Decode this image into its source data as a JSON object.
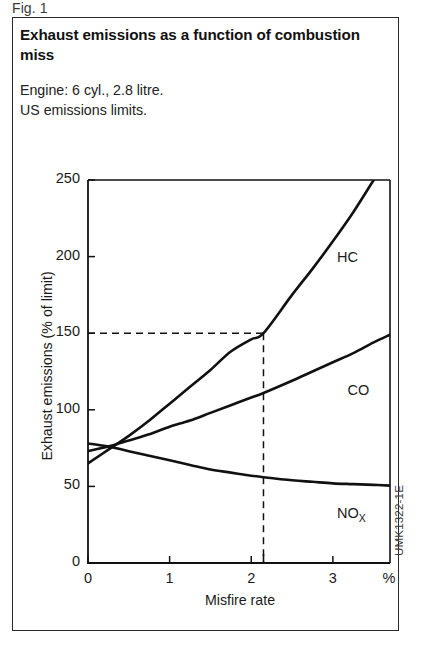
{
  "figure_number": "Fig. 1",
  "title": "Exhaust emissions as a function of combustion miss",
  "subtitle_lines": [
    "Engine: 6 cyl., 2.8 litre.",
    "US emissions limits."
  ],
  "source_code": "UMK1322-1E",
  "colors": {
    "ink": "#1a1a1a",
    "border": "#2b2b2b",
    "curve": "#111111",
    "background": "#ffffff"
  },
  "chart_data": {
    "type": "line",
    "title": "Exhaust emissions as a function of combustion miss",
    "xlabel": "Misfire rate",
    "ylabel": "Exhaust emissions (% of limit)",
    "x_unit": "%",
    "xlim": [
      0,
      3.7
    ],
    "ylim": [
      0,
      250
    ],
    "xticks": [
      0,
      1,
      2,
      3
    ],
    "xtick_labels": [
      "0",
      "1",
      "2",
      "3"
    ],
    "yticks": [
      0,
      50,
      100,
      150,
      200,
      250
    ],
    "ytick_labels": [
      "0",
      "50",
      "100",
      "150",
      "200",
      "250"
    ],
    "grid": false,
    "legend": "inline-curve-labels",
    "series": [
      {
        "name": "HC",
        "label": "HC",
        "x": [
          0,
          0.25,
          0.5,
          0.75,
          1.0,
          1.25,
          1.5,
          1.75,
          2.0,
          2.15,
          2.5,
          2.75,
          3.0,
          3.25,
          3.5
        ],
        "values": [
          65,
          74,
          83,
          93,
          104,
          115,
          126,
          138,
          146,
          150,
          175,
          192,
          210,
          229,
          250
        ]
      },
      {
        "name": "CO",
        "label": "CO",
        "x": [
          0,
          0.25,
          0.5,
          0.75,
          1.0,
          1.25,
          1.5,
          1.75,
          2.0,
          2.15,
          2.5,
          2.75,
          3.0,
          3.25,
          3.5,
          3.7
        ],
        "values": [
          73,
          76,
          80,
          84,
          89,
          93,
          98,
          103,
          108,
          111,
          119,
          125,
          131,
          137,
          144,
          149
        ]
      },
      {
        "name": "NOx",
        "label": "NO",
        "label_sub": "X",
        "x": [
          0,
          0.25,
          0.5,
          0.75,
          1.0,
          1.25,
          1.5,
          1.75,
          2.0,
          2.15,
          2.5,
          2.75,
          3.0,
          3.25,
          3.5,
          3.7
        ],
        "values": [
          78,
          76,
          73,
          70,
          67,
          64,
          61,
          59,
          57,
          56,
          54,
          53,
          52,
          51.5,
          51,
          50.5
        ]
      }
    ],
    "annotations": [
      {
        "type": "crosshair",
        "style": "dashed",
        "x": 2.15,
        "y": 150,
        "description": "Dashed lines marking HC reaching 150% of limit at 2.15% misfire rate"
      }
    ]
  }
}
